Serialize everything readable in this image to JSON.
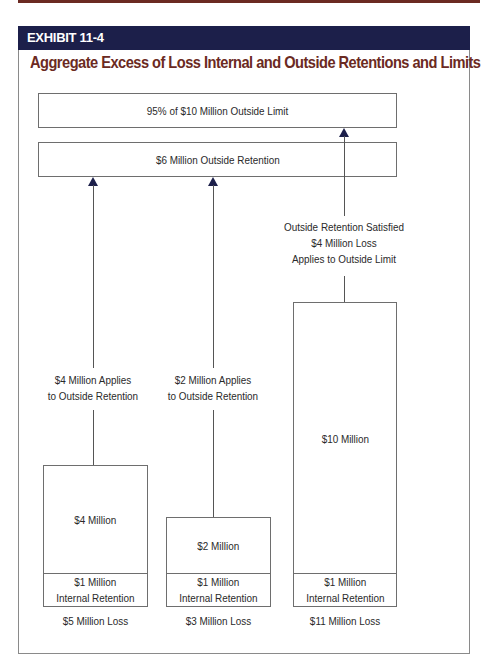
{
  "exhibit": {
    "label": "EXHIBIT 11-4",
    "title": "Aggregate Excess of Loss Internal and Outside Retentions and Limits"
  },
  "colors": {
    "header_bg": "#1c1f4a",
    "title_color": "#6b2a22",
    "arrow_color": "#1c1f4a"
  },
  "layers": {
    "outside_limit": "95% of $10 Million Outside Limit",
    "outside_retention": "$6 Million Outside Retention"
  },
  "columns": [
    {
      "annotation_line1": "$4 Million Applies",
      "annotation_line2": "to Outside Retention",
      "excess_amount": "$4 Million",
      "internal_line1": "$1 Million",
      "internal_line2": "Internal Retention",
      "total_loss": "$5 Million Loss"
    },
    {
      "annotation_line1": "$2 Million Applies",
      "annotation_line2": "to Outside Retention",
      "excess_amount": "$2 Million",
      "internal_line1": "$1 Million",
      "internal_line2": "Internal Retention",
      "total_loss": "$3 Million Loss"
    },
    {
      "annotation_line1": "Outside Retention Satisfied",
      "annotation_line2": "$4 Million Loss",
      "annotation_line3": "Applies to Outside Limit",
      "excess_amount": "$10 Million",
      "internal_line1": "$1 Million",
      "internal_line2": "Internal Retention",
      "total_loss": "$11 Million Loss"
    }
  ]
}
